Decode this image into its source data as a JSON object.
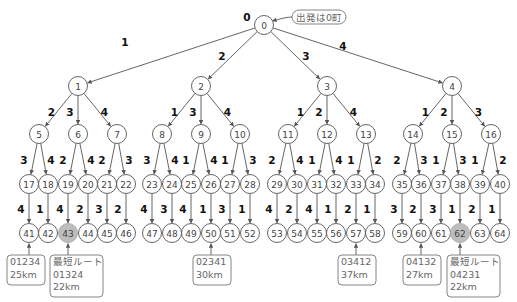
{
  "diagram": {
    "root": {
      "id": "0",
      "x": 264,
      "y": 25,
      "label": "0",
      "label_x": 247,
      "label_y": 17
    },
    "start_callout": {
      "text": "出発は0町",
      "x": 292,
      "y": 10,
      "w": 54,
      "h": 14
    },
    "node_radius": 9.5,
    "level_y": [
      25,
      86,
      134,
      184,
      233
    ],
    "level1": [
      {
        "id": "1",
        "x": 78,
        "edge_label": "1",
        "lx": 125,
        "ly": 42
      },
      {
        "id": "2",
        "x": 201,
        "edge_label": "2",
        "lx": 222,
        "ly": 56
      },
      {
        "id": "3",
        "x": 327,
        "edge_label": "3",
        "lx": 306,
        "ly": 56
      },
      {
        "id": "4",
        "x": 452,
        "edge_label": "4",
        "lx": 343,
        "ly": 46
      }
    ],
    "level2": [
      {
        "id": "5",
        "parent": "1",
        "x": 39,
        "edge_label": "2"
      },
      {
        "id": "6",
        "parent": "1",
        "x": 78,
        "edge_label": "3"
      },
      {
        "id": "7",
        "parent": "1",
        "x": 117,
        "edge_label": "4"
      },
      {
        "id": "8",
        "parent": "2",
        "x": 162,
        "edge_label": "1"
      },
      {
        "id": "9",
        "parent": "2",
        "x": 201,
        "edge_label": "3"
      },
      {
        "id": "10",
        "parent": "2",
        "x": 240,
        "edge_label": "4"
      },
      {
        "id": "11",
        "parent": "3",
        "x": 288,
        "edge_label": "1"
      },
      {
        "id": "12",
        "parent": "3",
        "x": 327,
        "edge_label": "2"
      },
      {
        "id": "13",
        "parent": "3",
        "x": 366,
        "edge_label": "4"
      },
      {
        "id": "14",
        "parent": "4",
        "x": 413,
        "edge_label": "1"
      },
      {
        "id": "15",
        "parent": "4",
        "x": 452,
        "edge_label": "2"
      },
      {
        "id": "16",
        "parent": "4",
        "x": 491,
        "edge_label": "3"
      }
    ],
    "level3": [
      {
        "id": "17",
        "parent": "5",
        "x": 29,
        "edge_label": "3"
      },
      {
        "id": "18",
        "parent": "5",
        "x": 48,
        "edge_label": "4"
      },
      {
        "id": "19",
        "parent": "6",
        "x": 68,
        "edge_label": "2"
      },
      {
        "id": "20",
        "parent": "6",
        "x": 88,
        "edge_label": "4"
      },
      {
        "id": "21",
        "parent": "7",
        "x": 107,
        "edge_label": "2"
      },
      {
        "id": "22",
        "parent": "7",
        "x": 126,
        "edge_label": "3"
      },
      {
        "id": "23",
        "parent": "8",
        "x": 152,
        "edge_label": "3"
      },
      {
        "id": "24",
        "parent": "8",
        "x": 172,
        "edge_label": "4"
      },
      {
        "id": "25",
        "parent": "9",
        "x": 191,
        "edge_label": "1"
      },
      {
        "id": "26",
        "parent": "9",
        "x": 211,
        "edge_label": "4"
      },
      {
        "id": "27",
        "parent": "10",
        "x": 230,
        "edge_label": "1"
      },
      {
        "id": "28",
        "parent": "10",
        "x": 250,
        "edge_label": "3"
      },
      {
        "id": "29",
        "parent": "11",
        "x": 277,
        "edge_label": "2"
      },
      {
        "id": "30",
        "parent": "11",
        "x": 297,
        "edge_label": "4"
      },
      {
        "id": "31",
        "parent": "12",
        "x": 317,
        "edge_label": "1"
      },
      {
        "id": "32",
        "parent": "12",
        "x": 336,
        "edge_label": "4"
      },
      {
        "id": "33",
        "parent": "13",
        "x": 356,
        "edge_label": "1"
      },
      {
        "id": "34",
        "parent": "13",
        "x": 375,
        "edge_label": "2"
      },
      {
        "id": "35",
        "parent": "14",
        "x": 402,
        "edge_label": "2"
      },
      {
        "id": "36",
        "parent": "14",
        "x": 421,
        "edge_label": "3"
      },
      {
        "id": "37",
        "parent": "15",
        "x": 441,
        "edge_label": "1"
      },
      {
        "id": "38",
        "parent": "15",
        "x": 460,
        "edge_label": "3"
      },
      {
        "id": "39",
        "parent": "16",
        "x": 480,
        "edge_label": "1"
      },
      {
        "id": "40",
        "parent": "16",
        "x": 500,
        "edge_label": "2"
      }
    ],
    "level4": [
      {
        "id": "41",
        "parent": "17",
        "edge_label": "4"
      },
      {
        "id": "42",
        "parent": "18",
        "edge_label": "1"
      },
      {
        "id": "43",
        "parent": "19",
        "edge_label": "4",
        "highlight": true
      },
      {
        "id": "44",
        "parent": "20",
        "edge_label": "2"
      },
      {
        "id": "45",
        "parent": "21",
        "edge_label": "3"
      },
      {
        "id": "46",
        "parent": "22",
        "edge_label": "2"
      },
      {
        "id": "47",
        "parent": "23",
        "edge_label": "4"
      },
      {
        "id": "48",
        "parent": "24",
        "edge_label": "3"
      },
      {
        "id": "49",
        "parent": "25",
        "edge_label": "4"
      },
      {
        "id": "50",
        "parent": "26",
        "edge_label": "1"
      },
      {
        "id": "51",
        "parent": "27",
        "edge_label": "3"
      },
      {
        "id": "52",
        "parent": "28",
        "edge_label": "1"
      },
      {
        "id": "53",
        "parent": "29",
        "edge_label": "4"
      },
      {
        "id": "54",
        "parent": "30",
        "edge_label": "2"
      },
      {
        "id": "55",
        "parent": "31",
        "edge_label": "4"
      },
      {
        "id": "56",
        "parent": "32",
        "edge_label": "1"
      },
      {
        "id": "57",
        "parent": "33",
        "edge_label": "2"
      },
      {
        "id": "58",
        "parent": "34",
        "edge_label": "1"
      },
      {
        "id": "59",
        "parent": "35",
        "edge_label": "3"
      },
      {
        "id": "60",
        "parent": "36",
        "edge_label": "2"
      },
      {
        "id": "61",
        "parent": "37",
        "edge_label": "3"
      },
      {
        "id": "62",
        "parent": "38",
        "edge_label": "1",
        "highlight": true
      },
      {
        "id": "63",
        "parent": "39",
        "edge_label": "2"
      },
      {
        "id": "64",
        "parent": "40",
        "edge_label": "1"
      }
    ],
    "route_boxes": [
      {
        "target": "41",
        "x": 7,
        "y": 255,
        "w": 38,
        "h": 30,
        "lines": [
          "01234",
          "25km"
        ]
      },
      {
        "target": "43",
        "x": 50,
        "y": 255,
        "w": 53,
        "h": 42,
        "lines": [
          "最短ルート",
          "01324",
          "22km"
        ],
        "shortest": true
      },
      {
        "target": "50",
        "x": 193,
        "y": 255,
        "w": 38,
        "h": 30,
        "lines": [
          "02341",
          "30km"
        ]
      },
      {
        "target": "57",
        "x": 338,
        "y": 255,
        "w": 38,
        "h": 30,
        "lines": [
          "03412",
          "37km"
        ]
      },
      {
        "target": "60",
        "x": 403,
        "y": 255,
        "w": 38,
        "h": 30,
        "lines": [
          "04132",
          "27km"
        ]
      },
      {
        "target": "62",
        "x": 447,
        "y": 255,
        "w": 53,
        "h": 42,
        "lines": [
          "最短ルート",
          "04231",
          "22km"
        ],
        "shortest": true
      }
    ]
  }
}
